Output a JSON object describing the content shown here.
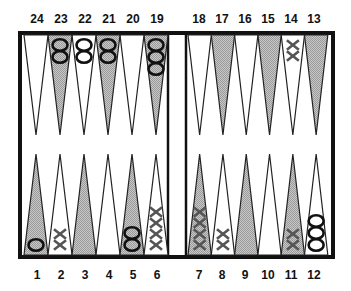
{
  "board": {
    "title": "Backgammon position",
    "colors": {
      "frame": "#111111",
      "shaded_point": "#b8b8b8",
      "light_point": "#ffffff",
      "checker_o_stroke": "#111111",
      "checker_x_stroke": "#555555"
    },
    "top_labels": [
      "24",
      "23",
      "22",
      "21",
      "20",
      "19",
      "18",
      "17",
      "16",
      "15",
      "14",
      "13"
    ],
    "bottom_labels": [
      "1",
      "2",
      "3",
      "4",
      "5",
      "6",
      "7",
      "8",
      "9",
      "10",
      "11",
      "12"
    ],
    "shaded_points": [
      23,
      21,
      19,
      17,
      15,
      13,
      1,
      3,
      5,
      7,
      9,
      11
    ],
    "positions": [
      {
        "point": 1,
        "player": "O",
        "count": 1
      },
      {
        "point": 2,
        "player": "X",
        "count": 2
      },
      {
        "point": 5,
        "player": "O",
        "count": 2
      },
      {
        "point": 6,
        "player": "X",
        "count": 4
      },
      {
        "point": 7,
        "player": "X",
        "count": 4
      },
      {
        "point": 8,
        "player": "X",
        "count": 2
      },
      {
        "point": 11,
        "player": "X",
        "count": 2
      },
      {
        "point": 12,
        "player": "O",
        "count": 3
      },
      {
        "point": 14,
        "player": "X",
        "count": 2
      },
      {
        "point": 19,
        "player": "O",
        "count": 3
      },
      {
        "point": 21,
        "player": "O",
        "count": 2
      },
      {
        "point": 22,
        "player": "O",
        "count": 2
      },
      {
        "point": 23,
        "player": "O",
        "count": 2
      }
    ]
  }
}
